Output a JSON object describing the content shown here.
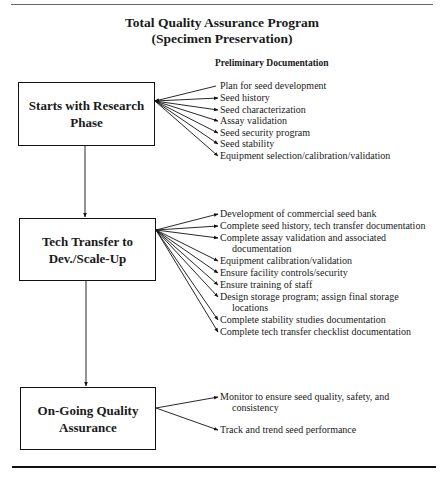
{
  "title": {
    "line1": "Total Quality Assurance Program",
    "line2": "(Specimen Preservation)"
  },
  "subheading": "Preliminary Documentation",
  "stages": [
    {
      "label_line1": "Starts with Research",
      "label_line2": "Phase",
      "items": [
        {
          "text": "Plan for seed development"
        },
        {
          "text": "Seed history"
        },
        {
          "text": "Seed characterization"
        },
        {
          "text": "Assay validation"
        },
        {
          "text": "Seed security program"
        },
        {
          "text": "Seed stability"
        },
        {
          "text": "Equipment selection/calibration/validation"
        }
      ]
    },
    {
      "label_line1": "Tech Transfer to",
      "label_line2": "Dev./Scale-Up",
      "items": [
        {
          "text": "Development of commercial seed bank"
        },
        {
          "text": "Complete seed history, tech transfer documentation"
        },
        {
          "text": "Complete assay validation and associated",
          "cont": "documentation"
        },
        {
          "text": "Equipment calibration/validation"
        },
        {
          "text": "Ensure facility controls/security"
        },
        {
          "text": "Ensure training of staff"
        },
        {
          "text": "Design storage program; assign final storage",
          "cont": "locations"
        },
        {
          "text": "Complete stability studies documentation"
        },
        {
          "text": "Complete tech transfer checklist documentation"
        }
      ]
    },
    {
      "label_line1": "On-Going Quality",
      "label_line2": "Assurance",
      "items": [
        {
          "text": "Monitor to ensure seed quality, safety, and",
          "cont": "consistency"
        },
        {
          "text": "Track and trend seed performance"
        }
      ]
    }
  ],
  "colors": {
    "ink": "#111111",
    "rule_top": "#6a6a6a",
    "background": "#ffffff"
  }
}
